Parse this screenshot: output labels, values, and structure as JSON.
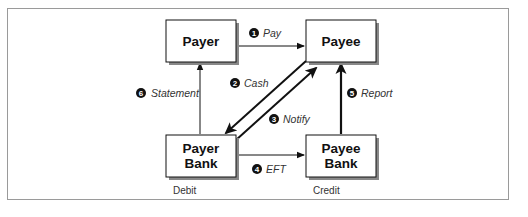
{
  "diagram": {
    "nodes": {
      "payer": {
        "label": "Payer"
      },
      "payee": {
        "label": "Payee"
      },
      "payer_bank": {
        "line1": "Payer",
        "line2": "Bank",
        "caption": "Debit"
      },
      "payee_bank": {
        "line1": "Payee",
        "line2": "Bank",
        "caption": "Credit"
      }
    },
    "edges": [
      {
        "step": "1",
        "label": "Pay",
        "from": "Payer",
        "to": "Payee"
      },
      {
        "step": "2",
        "label": "Cash",
        "from": "Payee",
        "to": "Payer Bank"
      },
      {
        "step": "3",
        "label": "Notify",
        "from": "Payer Bank",
        "to": "Payee"
      },
      {
        "step": "4",
        "label": "EFT",
        "from": "Payer Bank",
        "to": "Payee Bank"
      },
      {
        "step": "5",
        "label": "Report",
        "from": "Payee Bank",
        "to": "Payee"
      },
      {
        "step": "6",
        "label": "Statement",
        "from": "Payer Bank",
        "to": "Payer"
      }
    ],
    "colors": {
      "stroke": "#111111",
      "shadow": "#9a9a9a",
      "frame": "#9a9a9a"
    }
  }
}
